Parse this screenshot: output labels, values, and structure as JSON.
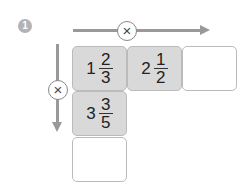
{
  "problem_number": "1",
  "operator_horizontal": "×",
  "operator_vertical": "×",
  "cells": [
    {
      "whole": "1",
      "numerator": "2",
      "denominator": "3",
      "filled": true
    },
    {
      "whole": "2",
      "numerator": "1",
      "denominator": "2",
      "filled": true
    },
    {
      "whole": "",
      "numerator": "",
      "denominator": "",
      "filled": false
    },
    {
      "whole": "3",
      "numerator": "3",
      "denominator": "5",
      "filled": true
    },
    {
      "whole": "",
      "numerator": "",
      "denominator": "",
      "filled": false
    }
  ],
  "colors": {
    "arrow": "#999999",
    "filled_cell": "#d9d9d9",
    "badge": "#b3b3b3"
  }
}
